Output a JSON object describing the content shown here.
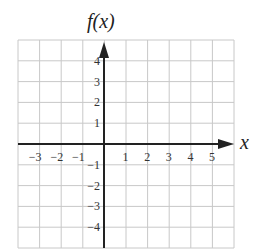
{
  "chart_data": {
    "type": "line",
    "title": "",
    "xlabel": "x",
    "ylabel": "f(x)",
    "xlim": [
      -4,
      6
    ],
    "ylim": [
      -5,
      5
    ],
    "grid": true,
    "x_ticks": [
      -3,
      -2,
      -1,
      1,
      2,
      3,
      4,
      5
    ],
    "y_ticks": [
      4,
      3,
      2,
      1,
      -1,
      -2,
      -3,
      -4
    ],
    "x_tick_labels": [
      "−3",
      "−2",
      "−1",
      "1",
      "2",
      "3",
      "4",
      "5"
    ],
    "y_tick_labels": [
      "4",
      "3",
      "2",
      "1",
      "−1",
      "−2",
      "−3",
      "−4"
    ],
    "series": [],
    "legend": null
  },
  "colors": {
    "grid": "#c8c8c8",
    "axis": "#222222",
    "text": "#333333"
  }
}
